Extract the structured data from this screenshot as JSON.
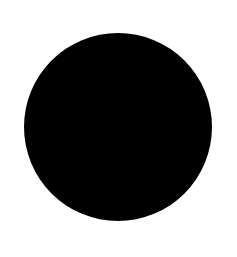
{
  "image": {
    "title": "Black Disc",
    "description": "A solid black filled circle centered on a plain white background.",
    "width": 237,
    "height": 257,
    "background_color": "#ffffff",
    "caption": ""
  },
  "shapes": [
    {
      "name": "filled-circle",
      "type": "circle",
      "fill_color": "#000000",
      "stroke_color": "none",
      "center_x": 118,
      "center_y": 127,
      "radius": 94,
      "diameter": 188,
      "bounds": {
        "left": 24,
        "top": 33,
        "right": 212,
        "bottom": 221
      },
      "edge": "anti-aliased"
    }
  ],
  "margins": {
    "top": 33,
    "bottom": 36,
    "left": 24,
    "right": 25
  },
  "text_content": []
}
